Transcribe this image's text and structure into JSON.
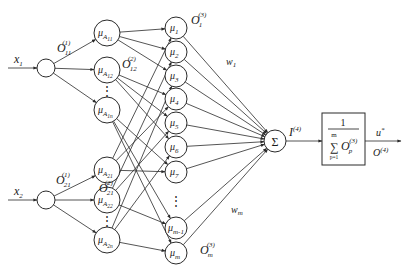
{
  "diagram": {
    "inputs": [
      {
        "id": "x1",
        "sym": "x",
        "sub": "1"
      },
      {
        "id": "x2",
        "sym": "x",
        "sub": "2"
      }
    ],
    "layer1_outputs": [
      {
        "sym": "O",
        "sub": "11",
        "sup": "(1)"
      },
      {
        "sym": "O",
        "sub": "21",
        "sup": "(1)"
      }
    ],
    "layer2_nodes": [
      {
        "id": "A11",
        "sym": "μ",
        "sub": "A",
        "subsub": "11"
      },
      {
        "id": "A12",
        "sym": "μ",
        "sub": "A",
        "subsub": "12"
      },
      {
        "id": "A1n",
        "sym": "μ",
        "sub": "A",
        "subsub": "1n"
      },
      {
        "id": "A21",
        "sym": "μ",
        "sub": "A",
        "subsub": "21"
      },
      {
        "id": "A22",
        "sym": "μ",
        "sub": "A",
        "subsub": "22"
      },
      {
        "id": "A2n",
        "sym": "μ",
        "sub": "A",
        "subsub": "2n"
      }
    ],
    "layer2_outputs": [
      {
        "sym": "O",
        "sub": "12",
        "sup": "(2)"
      },
      {
        "sym": "O",
        "sub": "21",
        "sup": "(2)"
      }
    ],
    "layer3_nodes": [
      {
        "id": "r1",
        "sym": "μ",
        "sub": "1"
      },
      {
        "id": "r2",
        "sym": "μ",
        "sub": "2"
      },
      {
        "id": "r3",
        "sym": "μ",
        "sub": "3"
      },
      {
        "id": "r4",
        "sym": "μ",
        "sub": "4"
      },
      {
        "id": "r5",
        "sym": "μ",
        "sub": "5"
      },
      {
        "id": "r6",
        "sym": "μ",
        "sub": "6"
      },
      {
        "id": "r7",
        "sym": "μ",
        "sub": "7"
      },
      {
        "id": "rm1",
        "sym": "μ",
        "sub": "m-1"
      },
      {
        "id": "rm",
        "sym": "μ",
        "sub": "m"
      }
    ],
    "layer3_outputs": [
      {
        "sym": "O",
        "sub": "1",
        "sup": "(3)"
      },
      {
        "sym": "O",
        "sub": "m",
        "sup": "(3)"
      }
    ],
    "weights": [
      {
        "sym": "w",
        "sub": "1"
      },
      {
        "sym": "w",
        "sub": "m"
      }
    ],
    "sum_node": {
      "id": "sum",
      "sym": "Σ"
    },
    "sum_output": {
      "sym": "I",
      "sup": "(4)"
    },
    "normalizer": {
      "numerator": "1",
      "sum": "∑",
      "upper": "m",
      "lower": "p=1",
      "term": "O",
      "term_sub": "p",
      "term_sup": "(3)"
    },
    "output": {
      "u": "u",
      "u_sup": "*",
      "o": "O",
      "o_sup": "(4)"
    },
    "ellipsis": "⋮",
    "edges": {
      "input_to_membership": [
        [
          "x1",
          "A11"
        ],
        [
          "x1",
          "A12"
        ],
        [
          "x1",
          "A1n"
        ],
        [
          "x2",
          "A21"
        ],
        [
          "x2",
          "A22"
        ],
        [
          "x2",
          "A2n"
        ]
      ],
      "membership_to_rule": [
        [
          "A11",
          "r1"
        ],
        [
          "A11",
          "r2"
        ],
        [
          "A11",
          "r3"
        ],
        [
          "A12",
          "r4"
        ],
        [
          "A12",
          "r5"
        ],
        [
          "A12",
          "r6"
        ],
        [
          "A1n",
          "r7"
        ],
        [
          "A1n",
          "rm1"
        ],
        [
          "A1n",
          "rm"
        ],
        [
          "A21",
          "r1"
        ],
        [
          "A22",
          "r2"
        ],
        [
          "A2n",
          "r3"
        ],
        [
          "A21",
          "r4"
        ],
        [
          "A22",
          "r5"
        ],
        [
          "A2n",
          "r6"
        ],
        [
          "A21",
          "r7"
        ],
        [
          "A22",
          "rm1"
        ],
        [
          "A2n",
          "rm"
        ]
      ],
      "rule_to_sum": [
        [
          "r1",
          "sum"
        ],
        [
          "r2",
          "sum"
        ],
        [
          "r3",
          "sum"
        ],
        [
          "r4",
          "sum"
        ],
        [
          "r5",
          "sum"
        ],
        [
          "r6",
          "sum"
        ],
        [
          "r7",
          "sum"
        ],
        [
          "rm1",
          "sum"
        ],
        [
          "rm",
          "sum"
        ]
      ]
    }
  }
}
